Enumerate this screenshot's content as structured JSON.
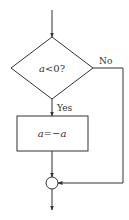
{
  "flowchart": {
    "decision": {
      "text": "a<0?",
      "var": "a",
      "rest": "<0?"
    },
    "process": {
      "text": "a=−a",
      "var1": "a",
      "op": "=−",
      "var2": "a"
    },
    "labels": {
      "yes": "Yes",
      "no": "No"
    },
    "colors": {
      "stroke": "#333333",
      "background": "#ffffff"
    }
  }
}
